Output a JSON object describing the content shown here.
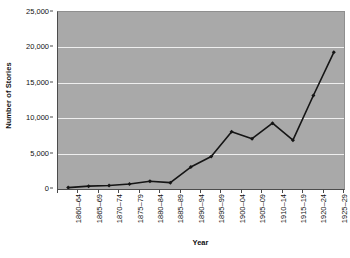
{
  "chart_data": {
    "type": "line",
    "title": "",
    "subtitle": "",
    "xlabel": "Year",
    "ylabel": "Number of Stories",
    "categories": [
      "1860–64",
      "1865–69",
      "1870–74",
      "1875–79",
      "1880–84",
      "1885–89",
      "1890–94",
      "1895–99",
      "1900–04",
      "1905–09",
      "1910–14",
      "1915–19",
      "1920–24",
      "1925–29"
    ],
    "values": [
      200,
      400,
      500,
      700,
      1100,
      900,
      3100,
      4600,
      8100,
      7100,
      9300,
      6900,
      13200,
      19300
    ],
    "series": [
      {
        "name": "Number of Stories",
        "values": [
          200,
          400,
          500,
          700,
          1100,
          900,
          3100,
          4600,
          8100,
          7100,
          9300,
          6900,
          13200,
          19300
        ]
      }
    ],
    "ylim": [
      0,
      25000
    ],
    "ytick_values": [
      0,
      5000,
      10000,
      15000,
      20000,
      25000
    ],
    "ytick_labels": [
      "0",
      "5,000",
      "10,000",
      "15,000",
      "20,000",
      "25,000"
    ],
    "grid": "horizontal",
    "legend": "none",
    "marker": "diamond",
    "colors": {
      "line": "#151515",
      "marker": "#151515",
      "plot_background": "#a9a9a9",
      "gridline": "#efefef",
      "axis": "#4c4c4c",
      "figure_background": "#ffffff",
      "text": "#111111"
    }
  }
}
